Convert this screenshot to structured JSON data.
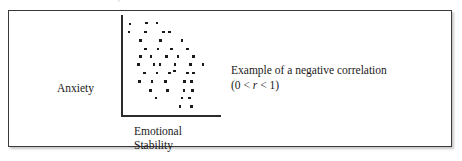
{
  "figure": {
    "background_color": "#ffffff",
    "frame_color": "#3a3a3a",
    "top_artifact": "'"
  },
  "scatter": {
    "y_axis_label": "Anxiety",
    "x_axis_label_line1": "Emotional",
    "x_axis_label_line2": "Stability",
    "axis_color": "#2b2b2b",
    "dot_color": "#1a1a1a"
  },
  "caption": {
    "line1": "Example of a negative correlation",
    "formula_open": "(0 < ",
    "formula_symbol": "r",
    "formula_close": " < 1)"
  },
  "chart_data": {
    "type": "scatter",
    "title": "",
    "xlabel": "Emotional Stability",
    "ylabel": "Anxiety",
    "annotations": [
      "Example of a negative correlation",
      "(0 < r < 1)"
    ],
    "grid": false,
    "legend": "none",
    "axes_style": "L-shaped (left spine + bottom spine only)",
    "xlim": [
      0,
      100
    ],
    "ylim": [
      0,
      100
    ],
    "xticks": [],
    "yticks": [],
    "correlation_sign": "negative",
    "n_points": 45,
    "points": [
      [
        6,
        96
      ],
      [
        23,
        97
      ],
      [
        34,
        97
      ],
      [
        5,
        88
      ],
      [
        22,
        88
      ],
      [
        41,
        88
      ],
      [
        47,
        88
      ],
      [
        17,
        79
      ],
      [
        38,
        79
      ],
      [
        60,
        79
      ],
      [
        22,
        70
      ],
      [
        35,
        70
      ],
      [
        49,
        70
      ],
      [
        66,
        70
      ],
      [
        17,
        62
      ],
      [
        28,
        62
      ],
      [
        44,
        62
      ],
      [
        56,
        62
      ],
      [
        72,
        62
      ],
      [
        15,
        54
      ],
      [
        31,
        54
      ],
      [
        37,
        54
      ],
      [
        53,
        54
      ],
      [
        69,
        54
      ],
      [
        82,
        54
      ],
      [
        21,
        45
      ],
      [
        34,
        45
      ],
      [
        47,
        45
      ],
      [
        66,
        45
      ],
      [
        72,
        45
      ],
      [
        16,
        36
      ],
      [
        29,
        36
      ],
      [
        43,
        36
      ],
      [
        63,
        36
      ],
      [
        70,
        36
      ],
      [
        27,
        27
      ],
      [
        45,
        27
      ],
      [
        62,
        27
      ],
      [
        71,
        27
      ],
      [
        33,
        19
      ],
      [
        60,
        19
      ],
      [
        68,
        19
      ],
      [
        58,
        10
      ],
      [
        70,
        10
      ],
      [
        52,
        47
      ]
    ]
  }
}
